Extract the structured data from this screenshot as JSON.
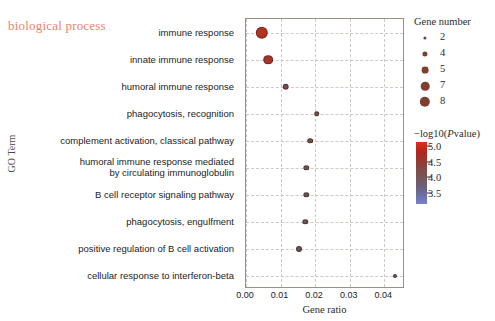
{
  "title": "biological process",
  "axes": {
    "x_title": "Gene ratio",
    "y_title": "GO Term",
    "x_ticks": [
      "0.00",
      "0.01",
      "0.02",
      "0.03",
      "0.04"
    ]
  },
  "size_legend": {
    "title": "Gene number",
    "items": [
      {
        "label": "2",
        "radius": 1.6
      },
      {
        "label": "4",
        "radius": 2.6
      },
      {
        "label": "5",
        "radius": 3.4
      },
      {
        "label": "7",
        "radius": 4.3
      },
      {
        "label": "8",
        "radius": 5.2
      }
    ]
  },
  "color_legend": {
    "title_prefix": "−log10(",
    "title_italic": "P",
    "title_suffix": "value)",
    "ticks": [
      "5.0",
      "4.5",
      "4.0",
      "3.5"
    ],
    "top_color": "#e02f1c",
    "bottom_color": "#7484c9"
  },
  "chart_data": {
    "type": "scatter",
    "title": "biological process",
    "xlabel": "Gene ratio",
    "ylabel": "GO Term",
    "xlim": [
      0.0,
      0.046
    ],
    "x_ticks": [
      0.0,
      0.01,
      0.02,
      0.03,
      0.04
    ],
    "grid": true,
    "legend_position": "right",
    "size_encoding": "Gene number",
    "color_encoding": "-log10(Pvalue)",
    "color_range": [
      3.5,
      5.0
    ],
    "categories": [
      "immune response",
      "innate immune response",
      "humoral immune response",
      "phagocytosis, recognition",
      "complement activation, classical pathway",
      "humoral immune response mediated\nby circulating immunoglobulin",
      "B cell receptor signaling pathway",
      "phagocytosis, engulfment",
      "positive regulation of B cell activation",
      "cellular response to interferon-beta"
    ],
    "points": [
      {
        "category": "immune response",
        "gene_ratio": 0.0045,
        "gene_number": 8,
        "neglog10p": 5.0,
        "color": "#b5321f",
        "radius": 6.2
      },
      {
        "category": "innate immune response",
        "gene_ratio": 0.0065,
        "gene_number": 7,
        "neglog10p": 4.8,
        "color": "#a83427",
        "radius": 4.8
      },
      {
        "category": "humoral immune response",
        "gene_ratio": 0.0115,
        "gene_number": 5,
        "neglog10p": 4.2,
        "color": "#7a4c47",
        "radius": 3.3
      },
      {
        "category": "phagocytosis, recognition",
        "gene_ratio": 0.0205,
        "gene_number": 4,
        "neglog10p": 4.0,
        "color": "#6e524f",
        "radius": 2.8
      },
      {
        "category": "complement activation, classical pathway",
        "gene_ratio": 0.0185,
        "gene_number": 4,
        "neglog10p": 4.0,
        "color": "#6c5350",
        "radius": 2.8
      },
      {
        "category": "humoral immune response mediated\nby circulating immunoglobulin",
        "gene_ratio": 0.0175,
        "gene_number": 4,
        "neglog10p": 3.9,
        "color": "#6a5454",
        "radius": 2.7
      },
      {
        "category": "B cell receptor signaling pathway",
        "gene_ratio": 0.0175,
        "gene_number": 4,
        "neglog10p": 3.9,
        "color": "#6a5454",
        "radius": 2.7
      },
      {
        "category": "phagocytosis, engulfment",
        "gene_ratio": 0.0172,
        "gene_number": 4,
        "neglog10p": 3.8,
        "color": "#6a5556",
        "radius": 2.7
      },
      {
        "category": "positive regulation of B cell activation",
        "gene_ratio": 0.0152,
        "gene_number": 4,
        "neglog10p": 3.7,
        "color": "#695658",
        "radius": 3.0
      },
      {
        "category": "cellular response to interferon-beta",
        "gene_ratio": 0.0432,
        "gene_number": 2,
        "neglog10p": 3.5,
        "color": "#5c5c64",
        "radius": 2.0
      }
    ]
  }
}
